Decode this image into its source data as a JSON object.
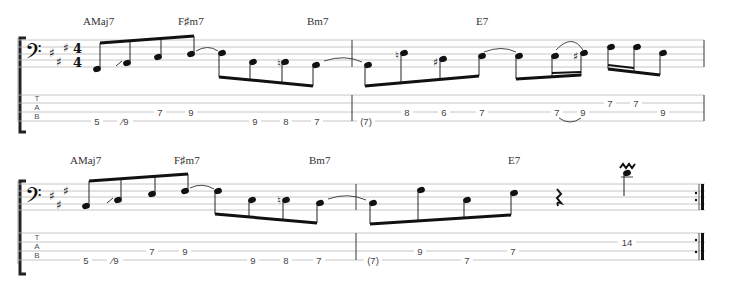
{
  "score": {
    "clef": "bass",
    "key_signature": "A major (3 sharps)",
    "time_signature": {
      "numerator": "4",
      "denominator": "4"
    },
    "tab_label": [
      "T",
      "A",
      "B"
    ]
  },
  "systems": [
    {
      "chords": [
        {
          "label": "AMaj7",
          "x": 88
        },
        {
          "label": "F♯m7",
          "x": 181
        },
        {
          "label": "Bm7",
          "x": 310
        },
        {
          "label": "E7",
          "x": 480
        }
      ],
      "measures": [
        {
          "tab": [
            {
              "fret": "5",
              "x": 97,
              "string": 4
            },
            {
              "fret": "∕9",
              "x": 125,
              "string": 4
            },
            {
              "fret": "7",
              "x": 160,
              "string": 3
            },
            {
              "fret": "9",
              "x": 191,
              "string": 3
            },
            {
              "fret": "9",
              "x": 255,
              "string": 4
            },
            {
              "fret": "8",
              "x": 286,
              "string": 4
            },
            {
              "fret": "7",
              "x": 317,
              "string": 4
            }
          ]
        },
        {
          "tab": [
            {
              "fret": "(7)",
              "x": 366,
              "string": 4
            },
            {
              "fret": "8",
              "x": 407,
              "string": 3
            },
            {
              "fret": "6",
              "x": 444,
              "string": 3
            },
            {
              "fret": "7",
              "x": 482,
              "string": 3
            },
            {
              "fret": "7",
              "x": 557,
              "string": 3
            },
            {
              "fret": "9",
              "x": 583,
              "string": 3
            },
            {
              "fret": "7",
              "x": 610,
              "string": 2
            },
            {
              "fret": "7",
              "x": 636,
              "string": 2
            },
            {
              "fret": "9",
              "x": 663,
              "string": 3
            }
          ]
        }
      ]
    },
    {
      "chords": [
        {
          "label": "AMaj7",
          "x": 70
        },
        {
          "label": "F♯m7",
          "x": 174
        },
        {
          "label": "Bm7",
          "x": 309
        },
        {
          "label": "E7",
          "x": 508
        }
      ],
      "measures": [
        {
          "tab": [
            {
              "fret": "5",
              "x": 86,
              "string": 4
            },
            {
              "fret": "∕9",
              "x": 115,
              "string": 4
            },
            {
              "fret": "7",
              "x": 152,
              "string": 3
            },
            {
              "fret": "9",
              "x": 185,
              "string": 3
            },
            {
              "fret": "9",
              "x": 253,
              "string": 4
            },
            {
              "fret": "8",
              "x": 286,
              "string": 4
            },
            {
              "fret": "7",
              "x": 319,
              "string": 4
            }
          ]
        },
        {
          "tab": [
            {
              "fret": "(7)",
              "x": 373,
              "string": 4
            },
            {
              "fret": "9",
              "x": 420,
              "string": 3
            },
            {
              "fret": "7",
              "x": 467,
              "string": 4
            },
            {
              "fret": "7",
              "x": 513,
              "string": 3
            },
            {
              "fret": "14",
              "x": 627,
              "string": 2
            }
          ]
        }
      ]
    }
  ]
}
